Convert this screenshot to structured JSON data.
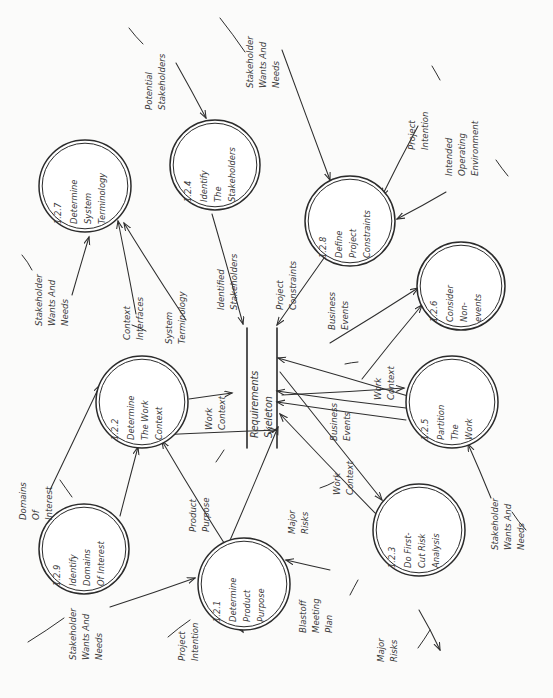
{
  "diagram": {
    "style": "hand-drawn data flow diagram, rotated 90 degrees",
    "ink_color": "#2b2b2b",
    "paper_color": "#fbfbfa"
  },
  "store": {
    "name": "requirements-skeleton",
    "label_line1": "Requirements",
    "label_line2": "Skeleton"
  },
  "processes": [
    {
      "key": "p127",
      "id": "1.2.7",
      "line1": "Determine",
      "line2": "System",
      "line3": "Terminology",
      "cx": 85,
      "cy": 186,
      "r": 46
    },
    {
      "key": "p124",
      "id": "1.2.4",
      "line1": "Identify",
      "line2": "The",
      "line3": "Stakeholders",
      "cx": 215,
      "cy": 165,
      "r": 45
    },
    {
      "key": "p128",
      "id": "1.2.8",
      "line1": "Define",
      "line2": "Project",
      "line3": "Constraints",
      "cx": 350,
      "cy": 221,
      "r": 45
    },
    {
      "key": "p126",
      "id": "1.2.6",
      "line1": "Consider",
      "line2": "Non-",
      "line3": "events",
      "cx": 461,
      "cy": 286,
      "r": 44
    },
    {
      "key": "p122",
      "id": "1.2.2",
      "line1": "Determine",
      "line2": "The Work",
      "line3": "Context",
      "cx": 142,
      "cy": 402,
      "r": 46
    },
    {
      "key": "p125",
      "id": "1.2.5",
      "line1": "Partition",
      "line2": "The",
      "line3": "Work",
      "cx": 452,
      "cy": 402,
      "r": 46
    },
    {
      "key": "p129",
      "id": "1.2.9",
      "line1": "Identify",
      "line2": "Domains",
      "line3": "Of Interest",
      "cx": 84,
      "cy": 549,
      "r": 45
    },
    {
      "key": "p121",
      "id": "1.2.1",
      "line1": "Determine",
      "line2": "Product",
      "line3": "Purpose",
      "cx": 244,
      "cy": 584,
      "r": 46
    },
    {
      "key": "p123",
      "id": "1.2.3",
      "line1": "Do First-",
      "line2": "Cut Risk",
      "line3": "Analysis",
      "cx": 419,
      "cy": 530,
      "r": 46
    }
  ],
  "flow_labels": [
    {
      "key": "f-potential-stakeholders",
      "line1": "Potential",
      "line2": "Stakeholders",
      "line3": "",
      "x": 152,
      "y": 52
    },
    {
      "key": "f-stakeholder-wants-top",
      "line1": "Stakeholder",
      "line2": "Wants And",
      "line3": "Needs",
      "x": 253,
      "y": 30
    },
    {
      "key": "f-project-intention-top",
      "line1": "Project",
      "line2": "Intention",
      "line3": "",
      "x": 415,
      "y": 92
    },
    {
      "key": "f-intended-operating-env",
      "line1": "Intended",
      "line2": "Operating",
      "line3": "Environment",
      "x": 452,
      "y": 118
    },
    {
      "key": "f-stakeholder-wants-left",
      "line1": "Stakeholder",
      "line2": "Wants And",
      "line3": "Needs",
      "x": 42,
      "y": 268
    },
    {
      "key": "f-context-interfaces",
      "line1": "Context",
      "line2": "Interfaces",
      "line3": "",
      "x": 130,
      "y": 282
    },
    {
      "key": "f-system-terminology",
      "line1": "System",
      "line2": "Terminology",
      "line3": "",
      "x": 172,
      "y": 286
    },
    {
      "key": "f-identified-stakeholders",
      "line1": "Identified",
      "line2": "Stakeholders",
      "line3": "",
      "x": 224,
      "y": 252
    },
    {
      "key": "f-project-constraints",
      "line1": "Project",
      "line2": "Constraints",
      "line3": "",
      "x": 283,
      "y": 252
    },
    {
      "key": "f-business-events-top",
      "line1": "Business",
      "line2": "Events",
      "line3": "",
      "x": 335,
      "y": 272
    },
    {
      "key": "f-work-context-right",
      "line1": "Work",
      "line2": "Context",
      "line3": "",
      "x": 381,
      "y": 342
    },
    {
      "key": "f-business-events-mid",
      "line1": "Business",
      "line2": "Events",
      "line3": "",
      "x": 337,
      "y": 383
    },
    {
      "key": "f-work-context-low",
      "line1": "Work",
      "line2": "Context",
      "line3": "",
      "x": 340,
      "y": 437
    },
    {
      "key": "f-domains-of-interest",
      "line1": "Domains",
      "line2": "Of",
      "line3": "Interest",
      "x": 26,
      "y": 462
    },
    {
      "key": "f-work-context-store",
      "line1": "Work",
      "line2": "Context",
      "line3": "",
      "x": 212,
      "y": 372
    },
    {
      "key": "f-product-purpose",
      "line1": "Product",
      "line2": "Purpose",
      "line3": "",
      "x": 196,
      "y": 474
    },
    {
      "key": "f-major-risks-center",
      "line1": "Major",
      "line2": "Risks",
      "line3": "",
      "x": 295,
      "y": 476
    },
    {
      "key": "f-stakeholder-wants-bottomleft",
      "line1": "Stakeholder",
      "line2": "Wants And",
      "line3": "Needs",
      "x": 76,
      "y": 602
    },
    {
      "key": "f-project-intention-bottom",
      "line1": "Project",
      "line2": "Intention",
      "line3": "",
      "x": 185,
      "y": 603
    },
    {
      "key": "f-blastoff-meeting-plan",
      "line1": "Blastoff",
      "line2": "Meeting",
      "line3": "Plan",
      "x": 306,
      "y": 575
    },
    {
      "key": "f-major-risks-bottom",
      "line1": "Major",
      "line2": "Risks",
      "line3": "",
      "x": 384,
      "y": 604
    },
    {
      "key": "f-stakeholder-wants-right",
      "line1": "Stakeholder",
      "line2": "Wants And",
      "line3": "Needs",
      "x": 498,
      "y": 492
    }
  ],
  "edges": [
    {
      "key": "e-potential-to-124",
      "d": "M 176 63 L 206 118"
    },
    {
      "key": "e-wants-to-128",
      "d": "M 282 50 L 330 180"
    },
    {
      "key": "e-intention-to-128",
      "d": "M 418 126 L 382 196"
    },
    {
      "key": "e-env-to-128",
      "d": "M 446 192 L 397 219"
    },
    {
      "key": "e-wants-to-127",
      "d": "M 72 295 L 89 237"
    },
    {
      "key": "e-context-to-127",
      "d": "M 136 314 L 118 221"
    },
    {
      "key": "e-systerm-from-127",
      "d": "M 186 320 L 124 223"
    },
    {
      "key": "e-124-to-store",
      "d": "M 212 214 L 243 324"
    },
    {
      "key": "e-128-to-store",
      "d": "M 324 258 L 277 325"
    },
    {
      "key": "e-store-to-126",
      "d": "M 330 343 L 418 288"
    },
    {
      "key": "e-work-to-126",
      "d": "M 362 379 L 422 305"
    },
    {
      "key": "e-122-to-store",
      "d": "M 189 399 L 232 393"
    },
    {
      "key": "e-125-to-store1",
      "d": "M 408 396 L 278 358"
    },
    {
      "key": "e-125-to-store2",
      "d": "M 406 408 L 277 391"
    },
    {
      "key": "e-125-to-store3",
      "d": "M 406 420 L 277 402"
    },
    {
      "key": "e-store-to-123",
      "d": "M 280 372 L 382 500"
    },
    {
      "key": "e-store-to-125",
      "d": "M 282 395 L 404 388"
    },
    {
      "key": "e-123-to-store",
      "d": "M 378 516 L 280 414"
    },
    {
      "key": "e-129-to-122",
      "d": "M 120 516 L 138 447"
    },
    {
      "key": "e-121-to-store",
      "d": "M 228 545 L 278 427"
    },
    {
      "key": "e-121-to-122",
      "d": "M 226 546 L 162 441"
    },
    {
      "key": "e-122-down-to-129",
      "d": "M 116 437 L 276 430"
    },
    {
      "key": "e-domains-to-122",
      "d": "M 50 490 L 100 385"
    },
    {
      "key": "e-wants-to-121",
      "d": "M 110 607 L 195 578"
    },
    {
      "key": "e-intention-to-121",
      "d": "M 218 600 L 243 632"
    },
    {
      "key": "e-blastoff-to-121",
      "d": "M 330 570 L 286 560"
    },
    {
      "key": "e-wants-to-125",
      "d": "M 491 498 L 468 444"
    },
    {
      "key": "e-risks-from-123",
      "d": "M 419 610 L 440 650"
    }
  ],
  "edge_stubs": [
    {
      "key": "s-potential-stub",
      "d": "M 129 28 L 143 44"
    },
    {
      "key": "s-wants-top-stub",
      "d": "M 220 18 L 245 52"
    },
    {
      "key": "s-intention-stub",
      "d": "M 432 66 L 440 80"
    },
    {
      "key": "s-env-stub",
      "d": "M 496 160 L 508 176"
    },
    {
      "key": "s-wants-left-stub",
      "d": "M 22 255 L 32 270"
    },
    {
      "key": "s-context-stub",
      "d": "M 132 325 L 146 331"
    },
    {
      "key": "s-domains-stub",
      "d": "M 60 480 L 72 497"
    },
    {
      "key": "s-wants-bl-stub",
      "d": "M 28 642 L 64 618"
    },
    {
      "key": "s-intention-bottom-stub",
      "d": "M 168 637 L 190 620"
    },
    {
      "key": "s-blastoff-stub",
      "d": "M 350 595 L 358 580"
    },
    {
      "key": "s-risks-bottom-stub",
      "d": "M 418 648 L 430 630"
    },
    {
      "key": "s-wants-right-stub",
      "d": "M 526 530 L 512 512"
    },
    {
      "key": "s-business-events-stub",
      "d": "M 345 364 L 358 362"
    },
    {
      "key": "s-product-purpose-stub",
      "d": "M 216 462 L 224 450"
    },
    {
      "key": "s-major-risks-stub",
      "d": "M 320 488 L 334 482"
    }
  ]
}
